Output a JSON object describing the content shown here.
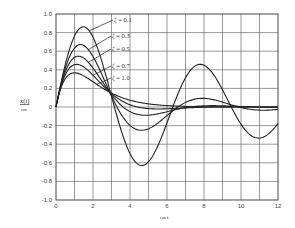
{
  "chart_data": {
    "type": "line",
    "title": "",
    "xlabel": "ωn t",
    "ylabel": "x(t) / ωn",
    "xlim": [
      0,
      12
    ],
    "ylim": [
      -1.0,
      1.0
    ],
    "grid": true,
    "x_ticks": [
      "0",
      "2",
      "4",
      "6",
      "8",
      "10",
      "12"
    ],
    "y_ticks": [
      "1.0",
      "0.8",
      "0.6",
      "0.4",
      "0.2",
      "0",
      "-0.2",
      "-0.4",
      "-0.6",
      "-0.8",
      "-1.0"
    ],
    "legend_position": "inline-annotations",
    "series": [
      {
        "name": "ζ = 0.1",
        "zeta": 0.1,
        "x": [
          0,
          1,
          1.5,
          2,
          3,
          4,
          4.6,
          5,
          6,
          7,
          7.7,
          8,
          9,
          10,
          11,
          12
        ],
        "values": [
          0,
          0.76,
          0.85,
          0.75,
          0.1,
          -0.51,
          -0.61,
          -0.58,
          -0.15,
          0.32,
          0.43,
          0.41,
          0.17,
          -0.21,
          -0.32,
          -0.22
        ]
      },
      {
        "name": "ζ = 0.3",
        "zeta": 0.3,
        "x": [
          0,
          1,
          1.3,
          2,
          3,
          4,
          4.5,
          5,
          6,
          7,
          8,
          9,
          10,
          11,
          12
        ],
        "values": [
          0,
          0.65,
          0.67,
          0.53,
          0.09,
          -0.19,
          -0.21,
          -0.2,
          -0.05,
          0.05,
          0.08,
          0.03,
          -0.02,
          -0.03,
          -0.01
        ]
      },
      {
        "name": "ζ = 0.5",
        "zeta": 0.5,
        "x": [
          0,
          1,
          1.2,
          2,
          3,
          4,
          5,
          6,
          7,
          8,
          12
        ],
        "values": [
          0,
          0.53,
          0.54,
          0.39,
          0.13,
          -0.03,
          -0.07,
          -0.05,
          -0.02,
          0.0,
          0.0
        ]
      },
      {
        "name": "ζ = 0.7",
        "zeta": 0.7,
        "x": [
          0,
          1,
          1.1,
          2,
          3,
          4,
          5,
          6,
          8,
          12
        ],
        "values": [
          0,
          0.45,
          0.45,
          0.3,
          0.13,
          0.02,
          -0.01,
          -0.01,
          0.0,
          0.0
        ]
      },
      {
        "name": "ζ = 1.0",
        "zeta": 1.0,
        "x": [
          0,
          1,
          2,
          3,
          4,
          5,
          6,
          8,
          12
        ],
        "values": [
          0,
          0.37,
          0.27,
          0.15,
          0.07,
          0.03,
          0.01,
          0.0,
          0.0
        ]
      }
    ]
  },
  "labels": {
    "ylabel_top": "x(t)",
    "ylabel_bottom": "ωn",
    "xlabel": "ωn t",
    "zeta": [
      "ζ = 0.1",
      "ζ = 0.3",
      "ζ = 0.5",
      "ζ = 0.7",
      "ζ = 1.0"
    ]
  }
}
